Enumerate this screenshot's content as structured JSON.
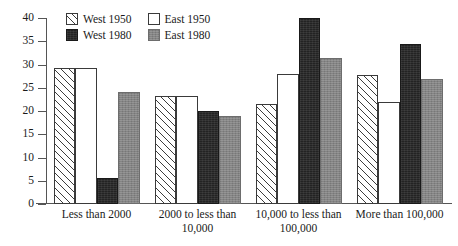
{
  "chart_data": {
    "type": "bar",
    "title": "",
    "subtitle": "",
    "xlabel": "",
    "ylabel": "",
    "ylim": [
      0,
      40
    ],
    "yticks": [
      0,
      5,
      10,
      15,
      20,
      25,
      30,
      35,
      40
    ],
    "grid": false,
    "legend_position": "top-center",
    "categories": [
      "Less than 2000",
      "2000 to less than 10,000",
      "10,000 to less than 100,000",
      "More than 100,000"
    ],
    "category_lines": [
      [
        "Less than 2000"
      ],
      [
        "2000 to less than",
        "10,000"
      ],
      [
        "10,000 to less than",
        "100,000"
      ],
      [
        "More than 100,000"
      ]
    ],
    "series": [
      {
        "name": "West 1950",
        "pattern": "diagonal-hatch",
        "color": "#ffffff",
        "values": [
          29.2,
          23.2,
          21.5,
          27.8
        ]
      },
      {
        "name": "East 1950",
        "pattern": "outline",
        "color": "#ffffff",
        "values": [
          29.2,
          23.3,
          27.9,
          22.0
        ]
      },
      {
        "name": "West 1980",
        "pattern": "solid-dark",
        "color": "#232323",
        "values": [
          5.6,
          20.1,
          40.0,
          34.5
        ]
      },
      {
        "name": "East 1980",
        "pattern": "solid-gray",
        "color": "#848484",
        "values": [
          24.1,
          19.0,
          31.5,
          26.9
        ]
      }
    ]
  },
  "legend": {
    "entries": [
      {
        "label": "West 1950",
        "swatch": "hatch-swatch"
      },
      {
        "label": "East 1950",
        "swatch": "white-swatch"
      },
      {
        "label": "West 1980",
        "swatch": "black-swatch"
      },
      {
        "label": "East 1980",
        "swatch": "gray-swatch"
      }
    ]
  },
  "axis": {
    "y_tick_labels": [
      "0",
      "5",
      "10",
      "15",
      "20",
      "25",
      "30",
      "35",
      "40"
    ]
  }
}
